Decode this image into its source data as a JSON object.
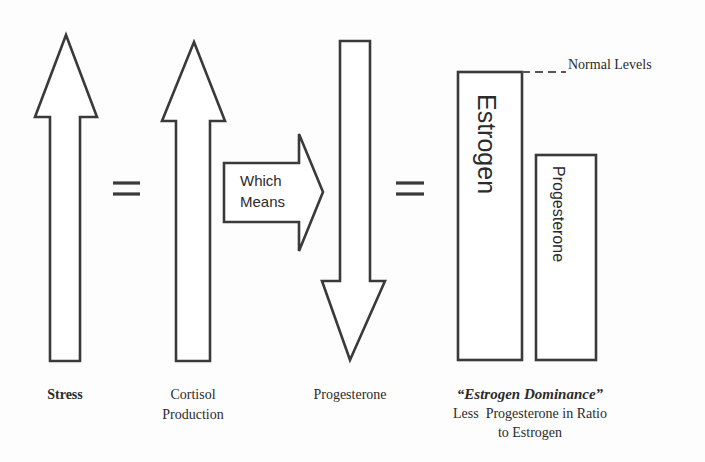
{
  "diagram": {
    "arrows": {
      "stress": {
        "direction": "up",
        "label": "Stress"
      },
      "cortisol": {
        "direction": "up",
        "label_line1": "Cortisol",
        "label_line2": "Production"
      },
      "which_means": {
        "direction": "right",
        "text_line1": "Which",
        "text_line2": "Means"
      },
      "progesterone": {
        "direction": "down",
        "label": "Progesterone"
      }
    },
    "equals_symbol": "=",
    "bars": {
      "estrogen": {
        "label": "Estrogen"
      },
      "progesterone": {
        "label": "Progesterone"
      }
    },
    "normal_levels_label": "Normal Levels",
    "conclusion": {
      "title": "“Estrogen Dominance”",
      "line1": "Less  Progesterone in Ratio",
      "line2": "to Estrogen"
    },
    "colors": {
      "stroke": "#3a3a3a",
      "fill": "#ffffff",
      "background": "#fdfdfd"
    }
  }
}
